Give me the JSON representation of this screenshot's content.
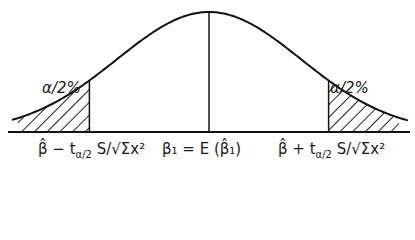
{
  "figure": {
    "type": "normal-distribution-confidence-interval",
    "left_tail_label": "α/2%",
    "right_tail_label": "α/2%",
    "lower_bound_label": "β̂ − t",
    "lower_bound_sub": "α/2",
    "lower_bound_tail": " S/√Σx²",
    "center_label": "β₁ = E (β̂₁)",
    "upper_bound_label": "β̂ + t",
    "upper_bound_sub": "α/2",
    "upper_bound_tail": " S/√Σx²",
    "critical_z": 1.3,
    "colors": {
      "line": "#111111",
      "hatch": "#222222",
      "background": "#ffffff"
    }
  }
}
